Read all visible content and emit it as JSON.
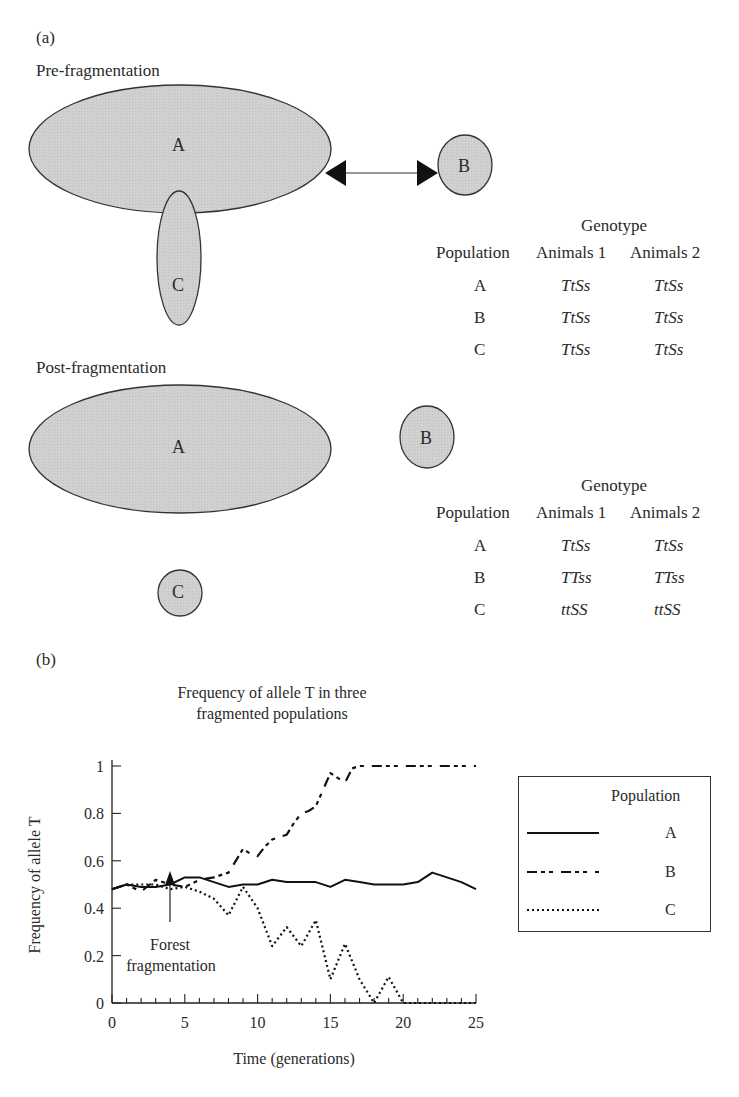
{
  "panel_a": {
    "label": "(a)",
    "pre": {
      "title": "Pre-fragmentation",
      "populations": {
        "A": "A",
        "B": "B",
        "C": "C"
      },
      "table": {
        "group_header": "Genotype",
        "columns": [
          "Population",
          "Animals 1",
          "Animals 2"
        ],
        "rows": [
          {
            "pop": "A",
            "a1": "TtSs",
            "a2": "TtSs"
          },
          {
            "pop": "B",
            "a1": "TtSs",
            "a2": "TtSs"
          },
          {
            "pop": "C",
            "a1": "TtSs",
            "a2": "TtSs"
          }
        ]
      }
    },
    "post": {
      "title": "Post-fragmentation",
      "populations": {
        "A": "A",
        "B": "B",
        "C": "C"
      },
      "table": {
        "group_header": "Genotype",
        "columns": [
          "Population",
          "Animals 1",
          "Animals 2"
        ],
        "rows": [
          {
            "pop": "A",
            "a1": "TtSs",
            "a2": "TtSs"
          },
          {
            "pop": "B",
            "a1": "TTss",
            "a2": "TTss"
          },
          {
            "pop": "C",
            "a1": "ttSS",
            "a2": "ttSS"
          }
        ]
      }
    }
  },
  "panel_b": {
    "label": "(b)",
    "title_line1": "Frequency of allele T in three",
    "title_line2": "fragmented populations",
    "annotation_line1": "Forest",
    "annotation_line2": "fragmentation",
    "legend": {
      "title": "Population",
      "items": [
        {
          "label": "A",
          "style": "solid"
        },
        {
          "label": "B",
          "style": "dash-dot"
        },
        {
          "label": "C",
          "style": "dotted"
        }
      ]
    }
  },
  "chart_data": {
    "type": "line",
    "title": "Frequency of allele T in three fragmented populations",
    "xlabel": "Time (generations)",
    "ylabel": "Frequency of allele T",
    "xlim": [
      0,
      25
    ],
    "ylim": [
      0,
      1
    ],
    "xticks": [
      0,
      5,
      10,
      15,
      20,
      25
    ],
    "yticks": [
      0,
      0.2,
      0.4,
      0.6,
      0.8,
      1
    ],
    "ytick_labels": [
      "0",
      "0.2",
      "0.4",
      "0.6",
      "0.8",
      "1"
    ],
    "grid": false,
    "legend_position": "right",
    "annotations": [
      {
        "text": "Forest fragmentation",
        "x": 4,
        "arrow_to_y": 0.45
      }
    ],
    "series": [
      {
        "name": "A",
        "style": "solid",
        "x": [
          0,
          1,
          2,
          3,
          4,
          5,
          6,
          7,
          8,
          9,
          10,
          11,
          12,
          13,
          14,
          15,
          16,
          17,
          18,
          19,
          20,
          21,
          22,
          23,
          24,
          25
        ],
        "values": [
          0.48,
          0.5,
          0.49,
          0.49,
          0.5,
          0.53,
          0.53,
          0.51,
          0.49,
          0.5,
          0.5,
          0.52,
          0.51,
          0.51,
          0.51,
          0.49,
          0.52,
          0.51,
          0.5,
          0.5,
          0.5,
          0.51,
          0.55,
          0.53,
          0.51,
          0.48
        ]
      },
      {
        "name": "B",
        "style": "dash-dot",
        "x": [
          0,
          1,
          2,
          3,
          4,
          5,
          6,
          7,
          8,
          8.5,
          9,
          9.5,
          10,
          10.5,
          11,
          11.5,
          12,
          12.5,
          13,
          13.5,
          14,
          14.5,
          15,
          15.5,
          16,
          16.5,
          17,
          18,
          19,
          20,
          21,
          22,
          23,
          24,
          25
        ],
        "values": [
          0.48,
          0.5,
          0.47,
          0.52,
          0.5,
          0.49,
          0.52,
          0.53,
          0.55,
          0.6,
          0.65,
          0.63,
          0.62,
          0.66,
          0.69,
          0.7,
          0.71,
          0.76,
          0.8,
          0.81,
          0.83,
          0.9,
          0.97,
          0.95,
          0.93,
          0.99,
          1.0,
          1.0,
          1.0,
          1.0,
          1.0,
          1.0,
          1.0,
          1.0,
          1.0
        ]
      },
      {
        "name": "C",
        "style": "dotted",
        "x": [
          0,
          1,
          2,
          3,
          4,
          5,
          6,
          7,
          8,
          9,
          10,
          11,
          12,
          13,
          14,
          15,
          16,
          17,
          18,
          19,
          20,
          21,
          22,
          23,
          24,
          25
        ],
        "values": [
          0.48,
          0.5,
          0.5,
          0.5,
          0.48,
          0.49,
          0.47,
          0.44,
          0.37,
          0.49,
          0.4,
          0.24,
          0.32,
          0.24,
          0.35,
          0.1,
          0.25,
          0.1,
          0.0,
          0.11,
          0.0,
          0.0,
          0.0,
          0.0,
          0.0,
          0.0
        ]
      }
    ]
  },
  "colors": {
    "population_fill": "#cfcfcf",
    "outline": "#333333",
    "ink": "#1a1a1a"
  }
}
